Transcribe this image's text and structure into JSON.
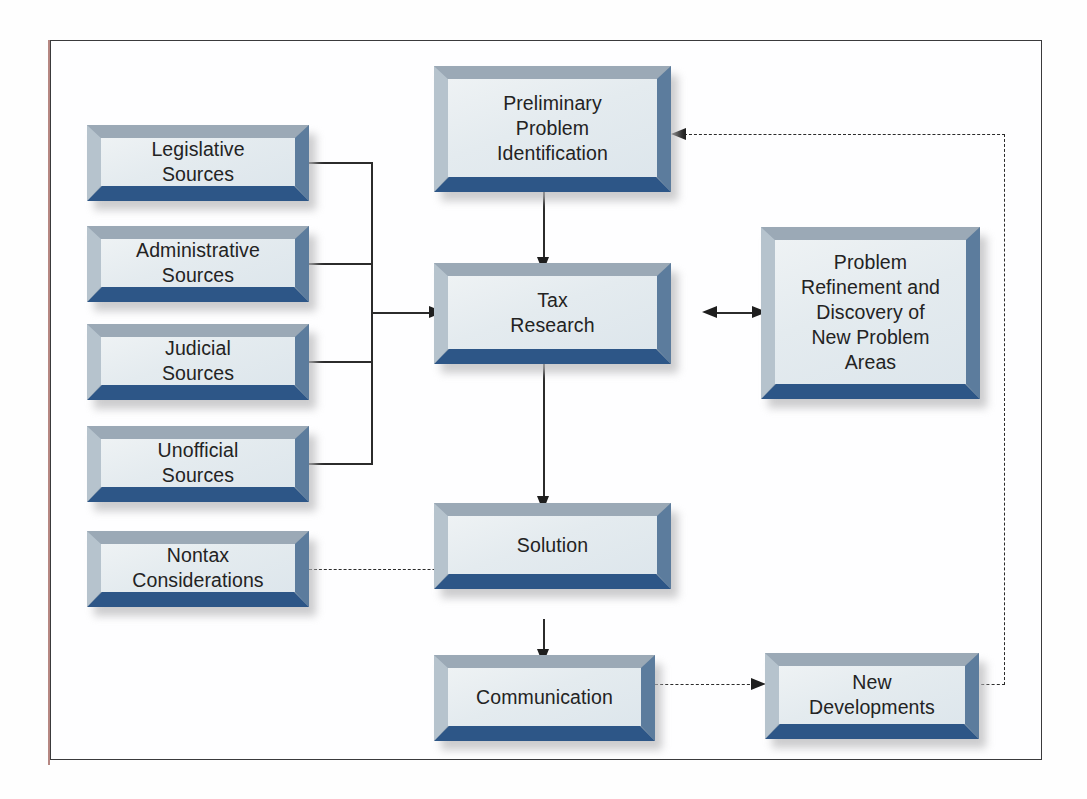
{
  "diagram": {
    "nodes": {
      "legislative_sources": {
        "label": "Legislative\nSources"
      },
      "administrative_sources": {
        "label": "Administrative\nSources"
      },
      "judicial_sources": {
        "label": "Judicial\nSources"
      },
      "unofficial_sources": {
        "label": "Unofficial\nSources"
      },
      "nontax_considerations": {
        "label": "Nontax\nConsiderations"
      },
      "preliminary_problem_identification": {
        "label": "Preliminary\nProblem\nIdentification"
      },
      "tax_research": {
        "label": "Tax\nResearch"
      },
      "problem_refinement": {
        "label": "Problem\nRefinement and\nDiscovery of\nNew Problem\nAreas"
      },
      "solution": {
        "label": "Solution"
      },
      "communication": {
        "label": "Communication"
      },
      "new_developments": {
        "label": "New\nDevelopments"
      }
    },
    "edges": [
      {
        "id": "sources-bus-to-tax-research",
        "from": "legislative_sources,administrative_sources,judicial_sources,unofficial_sources",
        "to": "tax_research",
        "style": "solid",
        "arrow": "single"
      },
      {
        "id": "preliminary-to-tax-research",
        "from": "preliminary_problem_identification",
        "to": "tax_research",
        "style": "solid",
        "arrow": "single"
      },
      {
        "id": "tax-research-to-problem-refinement",
        "from": "tax_research",
        "to": "problem_refinement",
        "style": "solid",
        "arrow": "double"
      },
      {
        "id": "tax-research-to-solution",
        "from": "tax_research",
        "to": "solution",
        "style": "solid",
        "arrow": "single"
      },
      {
        "id": "nontax-to-solution",
        "from": "nontax_considerations",
        "to": "solution",
        "style": "dashed",
        "arrow": "single"
      },
      {
        "id": "solution-to-communication",
        "from": "solution",
        "to": "communication",
        "style": "solid",
        "arrow": "single"
      },
      {
        "id": "communication-to-new-developments",
        "from": "communication",
        "to": "new_developments",
        "style": "dashed",
        "arrow": "single"
      },
      {
        "id": "new-developments-to-preliminary",
        "from": "new_developments",
        "to": "preliminary_problem_identification",
        "style": "dashed",
        "arrow": "single"
      }
    ],
    "colors": {
      "box_face": "#e8eef1",
      "bevel_top": "#9ba9b6",
      "bevel_left": "#b6c3cd",
      "bevel_right": "#5c7c9d",
      "bevel_bottom": "#2d5687",
      "line": "#2b2b2b",
      "frame": "#3a3a3c",
      "text": "#232323"
    }
  }
}
